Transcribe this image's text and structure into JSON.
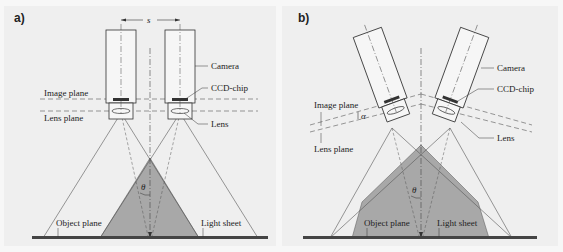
{
  "figure": {
    "panels": [
      {
        "tag": "a)",
        "labels": {
          "spacing": "s",
          "camera": "Camera",
          "ccd_chip": "CCD-chip",
          "image_plane": "Image plane",
          "lens_plane": "Lens plane",
          "lens": "Lens",
          "angle": "θ",
          "object_plane": "Object plane",
          "light_sheet": "Light sheet"
        }
      },
      {
        "tag": "b)",
        "labels": {
          "camera": "Camera",
          "ccd_chip": "CCD-chip",
          "image_plane": "Image plane",
          "tilt_angle": "α",
          "lens_plane": "Lens plane",
          "lens": "Lens",
          "angle": "θ",
          "object_plane": "Object plane",
          "light_sheet": "Light sheet"
        }
      }
    ],
    "colors": {
      "background": "#efefef",
      "overlap_fill": "#a8a8a8",
      "line": "#333333",
      "plane_bar": "#444444"
    }
  }
}
